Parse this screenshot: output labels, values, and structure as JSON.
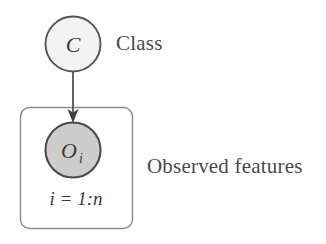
{
  "diagram": {
    "type": "plate-notation-graphical-model",
    "title": "",
    "nodes": [
      {
        "id": "class-node",
        "label": "C",
        "shape": "circle",
        "fill": "#f2f2f2",
        "stroke": "#555555",
        "cx": 73,
        "cy": 44,
        "r": 28,
        "observed": false,
        "side_label": "Class"
      },
      {
        "id": "observed-node",
        "label": "O",
        "subscript": "i",
        "shape": "circle",
        "fill": "#cdcdcd",
        "stroke": "#4a4a4a",
        "cx": 73,
        "cy": 150,
        "r": 28,
        "observed": true,
        "side_label": "Observed features"
      }
    ],
    "edges": [
      {
        "id": "class-to-observed",
        "from": "class-node",
        "to": "observed-node",
        "arrow": true,
        "stroke": "#555555"
      }
    ],
    "plate": {
      "id": "observed-plate",
      "label": "i = 1:n",
      "x": 20,
      "y": 107,
      "width": 112,
      "height": 121,
      "radius": 9,
      "stroke": "#8a8a8a"
    }
  },
  "labels": {
    "class": "Class",
    "observed_features": "Observed features",
    "node_class": "C",
    "node_observed": "O",
    "node_observed_subscript": "i",
    "plate_index": "i = 1:n"
  },
  "colors": {
    "background": "#ffffff",
    "node_light_fill": "#f2f2f2",
    "node_shaded_fill": "#cdcdcd",
    "node_stroke": "#555555",
    "plate_stroke": "#8a8a8a",
    "text": "#3a3a3a"
  }
}
